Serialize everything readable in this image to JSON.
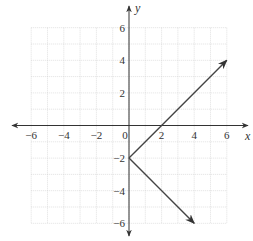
{
  "chart_data": {
    "type": "line",
    "title": "",
    "xlabel": "x",
    "ylabel": "y",
    "xlim": [
      -6,
      6
    ],
    "ylim": [
      -6,
      6
    ],
    "grid": true,
    "minor_grid_step": 1,
    "x_ticks": [
      -6,
      -4,
      -2,
      0,
      2,
      4,
      6
    ],
    "y_ticks": [
      -6,
      -4,
      -2,
      2,
      4,
      6
    ],
    "x_tick_labels": [
      "−6",
      "−4",
      "−2",
      "0",
      "2",
      "4",
      "6"
    ],
    "y_tick_labels": [
      "−6",
      "−4",
      "−2",
      "2",
      "4",
      "6"
    ],
    "series": [
      {
        "name": "upper ray",
        "points": [
          [
            0,
            -2
          ],
          [
            2,
            0
          ],
          [
            6,
            4
          ]
        ],
        "arrow_end": true
      },
      {
        "name": "lower ray",
        "points": [
          [
            0,
            -2
          ],
          [
            4,
            -6
          ]
        ],
        "arrow_end": true
      }
    ],
    "vertex": [
      0,
      -2
    ]
  },
  "colors": {
    "axis": "#333333",
    "grid": "#cccccc",
    "line": "#444444"
  }
}
